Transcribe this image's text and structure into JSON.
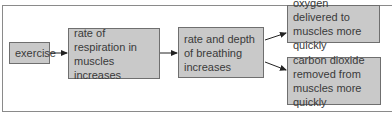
{
  "diagram": {
    "type": "flowchart",
    "nodes": [
      {
        "id": "exercise",
        "label": "exercise"
      },
      {
        "id": "respiration",
        "label": "rate of respiration in muscles increases"
      },
      {
        "id": "breathing",
        "label": "rate and depth of breathing increases"
      },
      {
        "id": "oxygen",
        "label": "oxygen delivered to muscles more quickly"
      },
      {
        "id": "co2",
        "label": "carbon dioxide removed from muscles more quickly"
      }
    ],
    "edges": [
      {
        "from": "exercise",
        "to": "respiration"
      },
      {
        "from": "respiration",
        "to": "breathing"
      },
      {
        "from": "breathing",
        "to": "oxygen"
      },
      {
        "from": "breathing",
        "to": "co2"
      }
    ],
    "colors": {
      "box_fill": "#c9c9c9",
      "box_border": "#6f6f6f",
      "text": "#3a3a3a",
      "frame": "#8a8a8a"
    }
  }
}
